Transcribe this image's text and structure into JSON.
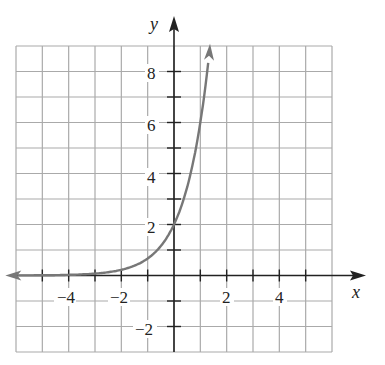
{
  "chart_data": {
    "type": "line",
    "title": "",
    "xlabel": "x",
    "ylabel": "y",
    "xlim": [
      -6,
      6
    ],
    "ylim": [
      -3,
      9
    ],
    "grid": true,
    "x_tick_labels": [
      "-4",
      "-2",
      "2",
      "4"
    ],
    "y_tick_labels": [
      "8",
      "6",
      "4",
      "2",
      "-2"
    ],
    "series": [
      {
        "name": "curve",
        "color": "#777777",
        "function": "y = 2·3^x",
        "x": [
          -6,
          -5,
          -4,
          -3,
          -2,
          -1,
          0,
          0.5,
          1,
          1.3
        ],
        "values": [
          0.003,
          0.008,
          0.025,
          0.074,
          0.22,
          0.67,
          2,
          3.46,
          6,
          8.3
        ]
      }
    ],
    "annotations": [
      "arrow at left end (approaching y=0)",
      "arrow at top end"
    ]
  },
  "labels": {
    "x_axis": "x",
    "y_axis": "y",
    "xt": [
      "−4",
      "−2",
      "2",
      "4"
    ],
    "yt": [
      "8",
      "6",
      "4",
      "2",
      "−2"
    ]
  }
}
